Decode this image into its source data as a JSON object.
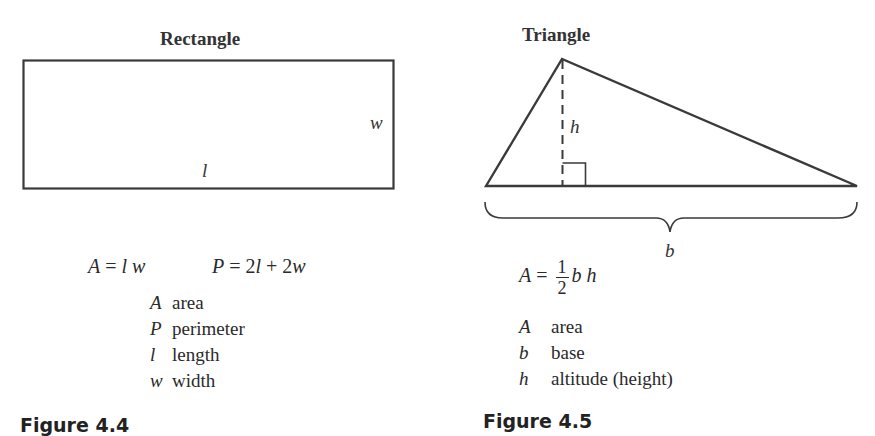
{
  "figures": [
    {
      "id": "rectangle",
      "title": "Rectangle",
      "side_labels": {
        "width": "w",
        "length": "l"
      },
      "formulas": {
        "area": {
          "lhs": "A",
          "eq": " = ",
          "rhs": "l w"
        },
        "perimeter": {
          "lhs": "P",
          "eq": " = ",
          "rhs_parts": [
            "2",
            "l",
            " + 2",
            "w"
          ]
        }
      },
      "legend": [
        {
          "symbol": "A",
          "meaning": "area"
        },
        {
          "symbol": "P",
          "meaning": "perimeter"
        },
        {
          "symbol": "l",
          "meaning": "length"
        },
        {
          "symbol": "w",
          "meaning": "width"
        }
      ],
      "caption": "Figure 4.4"
    },
    {
      "id": "triangle",
      "title": "Triangle",
      "side_labels": {
        "height": "h",
        "base": "b"
      },
      "formulas": {
        "area": {
          "lhs": "A",
          "eq": " = ",
          "frac_num": "1",
          "frac_den": "2",
          "rhs": "b h"
        }
      },
      "legend": [
        {
          "symbol": "A",
          "meaning": "area"
        },
        {
          "symbol": "b",
          "meaning": "base"
        },
        {
          "symbol": "h",
          "meaning": "altitude (height)"
        }
      ],
      "caption": "Figure 4.5"
    }
  ],
  "colors": {
    "stroke": "#3a3a3a",
    "text": "#2a2a2a"
  }
}
